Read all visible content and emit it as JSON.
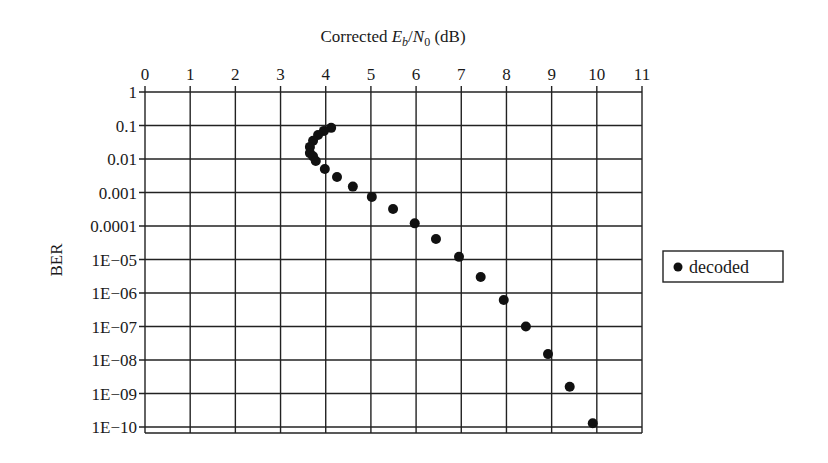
{
  "chart_data": {
    "type": "scatter",
    "title": "",
    "xlabel": "Corrected E_b/N_0 (dB)",
    "xlabel_parts": {
      "pre": "Corrected ",
      "E": "E",
      "b": "b",
      "slash": "/",
      "N": "N",
      "zero": "0",
      "post": " (dB)"
    },
    "ylabel": "BER",
    "x_axis_position": "top",
    "xlim": [
      0,
      11
    ],
    "ylim": [
      1e-10,
      1
    ],
    "yscale": "log",
    "grid": true,
    "x_ticks": [
      "0",
      "1",
      "2",
      "3",
      "4",
      "5",
      "6",
      "7",
      "8",
      "9",
      "10",
      "11"
    ],
    "y_ticks": [
      "1",
      "0.1",
      "0.01",
      "0.001",
      "0.0001",
      "1E−05",
      "1E−06",
      "1E−07",
      "1E−08",
      "1E−09",
      "1E−10"
    ],
    "legend": {
      "position": "right",
      "entries": [
        "decoded"
      ]
    },
    "series": [
      {
        "name": "decoded",
        "marker": "filled-circle",
        "color": "#111111",
        "x": [
          4.12,
          3.96,
          3.83,
          3.72,
          3.65,
          3.65,
          3.72,
          3.78,
          3.98,
          4.25,
          4.6,
          5.02,
          5.49,
          5.97,
          6.44,
          6.95,
          7.43,
          7.94,
          8.43,
          8.92,
          9.4,
          9.91
        ],
        "y": [
          0.085,
          0.069,
          0.052,
          0.035,
          0.023,
          0.015,
          0.012,
          0.0087,
          0.005,
          0.0029,
          0.0015,
          0.00074,
          0.00032,
          0.00012,
          4.1e-05,
          1.2e-05,
          3e-06,
          6.2e-07,
          1e-07,
          1.5e-08,
          1.6e-09,
          1.3e-10
        ]
      }
    ]
  }
}
